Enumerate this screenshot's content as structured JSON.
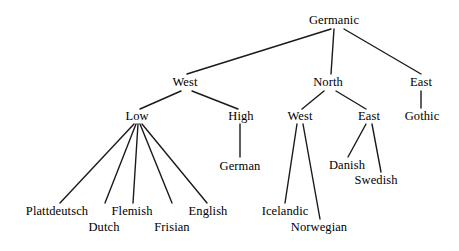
{
  "diagram": {
    "type": "tree",
    "orientation": "top-down",
    "line_color": "#1a1a1a",
    "text_color": "#000000",
    "background_color": "#ffffff",
    "nodes": [
      {
        "id": "germanic",
        "label": "Germanic",
        "x": 334,
        "y": 20,
        "level": 0
      },
      {
        "id": "west",
        "label": "West",
        "x": 185,
        "y": 82,
        "level": 1
      },
      {
        "id": "north",
        "label": "North",
        "x": 328,
        "y": 82,
        "level": 1
      },
      {
        "id": "east",
        "label": "East",
        "x": 421,
        "y": 82,
        "level": 1
      },
      {
        "id": "low",
        "label": "Low",
        "x": 137,
        "y": 116,
        "level": 2
      },
      {
        "id": "high",
        "label": "High",
        "x": 241,
        "y": 116,
        "level": 2
      },
      {
        "id": "north-west",
        "label": "West",
        "x": 300,
        "y": 116,
        "level": 2
      },
      {
        "id": "north-east",
        "label": "East",
        "x": 369,
        "y": 116,
        "level": 2
      },
      {
        "id": "gothic",
        "label": "Gothic",
        "x": 422,
        "y": 116,
        "level": 2
      },
      {
        "id": "german",
        "label": "German",
        "x": 240,
        "y": 166,
        "level": 3
      },
      {
        "id": "danish",
        "label": "Danish",
        "x": 347,
        "y": 165,
        "level": 3
      },
      {
        "id": "swedish",
        "label": "Swedish",
        "x": 376,
        "y": 180,
        "level": 3
      },
      {
        "id": "icelandic",
        "label": "Icelandic",
        "x": 285,
        "y": 211,
        "level": 3
      },
      {
        "id": "norwegian",
        "label": "Norwegian",
        "x": 319,
        "y": 227,
        "level": 3
      },
      {
        "id": "plattdeutsch",
        "label": "Plattdeutsch",
        "x": 57,
        "y": 211,
        "level": 3
      },
      {
        "id": "dutch",
        "label": "Dutch",
        "x": 104,
        "y": 227,
        "level": 3
      },
      {
        "id": "flemish",
        "label": "Flemish",
        "x": 132,
        "y": 211,
        "level": 3
      },
      {
        "id": "frisian",
        "label": "Frisian",
        "x": 172,
        "y": 227,
        "level": 3
      },
      {
        "id": "english",
        "label": "English",
        "x": 208,
        "y": 211,
        "level": 3
      }
    ],
    "edges": [
      {
        "from": "germanic",
        "to": "west",
        "x1": 331,
        "y1": 29,
        "x2": 187,
        "y2": 74
      },
      {
        "from": "germanic",
        "to": "north",
        "x1": 334,
        "y1": 29,
        "x2": 331,
        "y2": 74
      },
      {
        "from": "germanic",
        "to": "east",
        "x1": 344,
        "y1": 29,
        "x2": 421,
        "y2": 74
      },
      {
        "from": "west",
        "to": "low",
        "x1": 181,
        "y1": 91,
        "x2": 140,
        "y2": 109
      },
      {
        "from": "west",
        "to": "high",
        "x1": 192,
        "y1": 91,
        "x2": 238,
        "y2": 109
      },
      {
        "from": "north",
        "to": "north-west",
        "x1": 324,
        "y1": 91,
        "x2": 302,
        "y2": 109
      },
      {
        "from": "north",
        "to": "north-east",
        "x1": 336,
        "y1": 91,
        "x2": 366,
        "y2": 109
      },
      {
        "from": "east",
        "to": "gothic",
        "x1": 421,
        "y1": 91,
        "x2": 421,
        "y2": 108
      },
      {
        "from": "low",
        "to": "plattdeutsch",
        "x1": 134,
        "y1": 124,
        "x2": 60,
        "y2": 203
      },
      {
        "from": "low",
        "to": "dutch",
        "x1": 136,
        "y1": 124,
        "x2": 105,
        "y2": 203
      },
      {
        "from": "low",
        "to": "flemish",
        "x1": 138,
        "y1": 124,
        "x2": 133,
        "y2": 203
      },
      {
        "from": "low",
        "to": "frisian",
        "x1": 140,
        "y1": 124,
        "x2": 172,
        "y2": 203
      },
      {
        "from": "low",
        "to": "english",
        "x1": 142,
        "y1": 124,
        "x2": 207,
        "y2": 203
      },
      {
        "from": "high",
        "to": "german",
        "x1": 240,
        "y1": 124,
        "x2": 240,
        "y2": 157
      },
      {
        "from": "north-west",
        "to": "icelandic",
        "x1": 297,
        "y1": 124,
        "x2": 285,
        "y2": 203
      },
      {
        "from": "north-west",
        "to": "norwegian",
        "x1": 303,
        "y1": 124,
        "x2": 320,
        "y2": 219
      },
      {
        "from": "north-east",
        "to": "danish",
        "x1": 366,
        "y1": 124,
        "x2": 348,
        "y2": 157
      },
      {
        "from": "north-east",
        "to": "swedish",
        "x1": 372,
        "y1": 124,
        "x2": 381,
        "y2": 172
      }
    ]
  }
}
